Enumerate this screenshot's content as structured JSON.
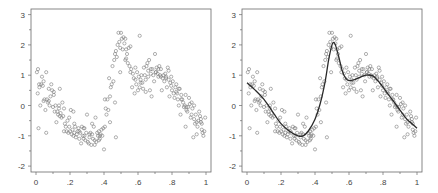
{
  "chart_data": [
    {
      "type": "scatter",
      "title": "",
      "xlabel": "",
      "ylabel": "",
      "xlim": [
        0,
        1
      ],
      "ylim": [
        -2,
        3
      ],
      "x_ticks": [
        0,
        0.2,
        0.4,
        0.6,
        0.8,
        1
      ],
      "x_tick_labels": [
        "0",
        ".2",
        ".4",
        ".6",
        ".8",
        "1"
      ],
      "y_ticks": [
        -2,
        -1,
        0,
        1,
        2,
        3
      ],
      "y_tick_labels": [
        "-2",
        "-1",
        "0",
        "1",
        "2",
        "3"
      ],
      "grid": false,
      "legend": null,
      "series": [
        {
          "name": "observations",
          "marker": "open-circle",
          "x": [
            0.005,
            0.01,
            0.012,
            0.018,
            0.02,
            0.025,
            0.03,
            0.035,
            0.04,
            0.045,
            0.05,
            0.055,
            0.06,
            0.065,
            0.07,
            0.075,
            0.08,
            0.085,
            0.09,
            0.095,
            0.1,
            0.105,
            0.11,
            0.115,
            0.12,
            0.125,
            0.13,
            0.135,
            0.14,
            0.145,
            0.15,
            0.155,
            0.16,
            0.165,
            0.17,
            0.175,
            0.18,
            0.185,
            0.19,
            0.195,
            0.2,
            0.205,
            0.21,
            0.215,
            0.22,
            0.225,
            0.23,
            0.235,
            0.24,
            0.245,
            0.25,
            0.255,
            0.26,
            0.265,
            0.27,
            0.275,
            0.28,
            0.285,
            0.29,
            0.295,
            0.3,
            0.305,
            0.31,
            0.315,
            0.32,
            0.325,
            0.33,
            0.335,
            0.34,
            0.345,
            0.35,
            0.355,
            0.36,
            0.365,
            0.37,
            0.375,
            0.38,
            0.385,
            0.39,
            0.395,
            0.4,
            0.405,
            0.41,
            0.415,
            0.42,
            0.425,
            0.43,
            0.435,
            0.44,
            0.445,
            0.45,
            0.455,
            0.46,
            0.465,
            0.47,
            0.475,
            0.48,
            0.485,
            0.49,
            0.495,
            0.5,
            0.505,
            0.51,
            0.515,
            0.52,
            0.525,
            0.53,
            0.535,
            0.54,
            0.545,
            0.55,
            0.555,
            0.56,
            0.565,
            0.57,
            0.575,
            0.58,
            0.585,
            0.59,
            0.595,
            0.6,
            0.605,
            0.61,
            0.615,
            0.62,
            0.625,
            0.63,
            0.635,
            0.64,
            0.645,
            0.65,
            0.655,
            0.66,
            0.665,
            0.67,
            0.675,
            0.68,
            0.685,
            0.69,
            0.695,
            0.7,
            0.705,
            0.71,
            0.715,
            0.72,
            0.725,
            0.73,
            0.735,
            0.74,
            0.745,
            0.75,
            0.755,
            0.76,
            0.765,
            0.77,
            0.775,
            0.78,
            0.785,
            0.79,
            0.795,
            0.8,
            0.805,
            0.81,
            0.815,
            0.82,
            0.825,
            0.83,
            0.835,
            0.84,
            0.845,
            0.85,
            0.855,
            0.86,
            0.865,
            0.87,
            0.875,
            0.88,
            0.885,
            0.89,
            0.895,
            0.9,
            0.905,
            0.91,
            0.915,
            0.92,
            0.925,
            0.93,
            0.935,
            0.94,
            0.945,
            0.95,
            0.955,
            0.96,
            0.965,
            0.97,
            0.975,
            0.98,
            0.985,
            0.99,
            0.995,
            0.015,
            0.045,
            0.075,
            0.105,
            0.135,
            0.165,
            0.195,
            0.225,
            0.255,
            0.285,
            0.315,
            0.345,
            0.375,
            0.405,
            0.435,
            0.465,
            0.495,
            0.525,
            0.555,
            0.585,
            0.615,
            0.645,
            0.675,
            0.705,
            0.735,
            0.765,
            0.795,
            0.825,
            0.855,
            0.885,
            0.915,
            0.945,
            0.975,
            0.06,
            0.14,
            0.22,
            0.28,
            0.33,
            0.37,
            0.47,
            0.53,
            0.61,
            0.66,
            0.72,
            0.78,
            0.84,
            0.88,
            0.93,
            0.97
          ],
          "y": [
            1.1,
            0.4,
            1.2,
            0.7,
            0.6,
            0.0,
            0.7,
            0.95,
            0.65,
            0.15,
            0.2,
            -0.15,
            1.1,
            0.2,
            0.1,
            0.15,
            0.0,
            0.3,
            0.7,
            0.5,
            -0.05,
            0.45,
            -0.2,
            0.0,
            -0.55,
            -0.2,
            -0.3,
            -0.1,
            -0.35,
            -0.25,
            -0.4,
            0.1,
            -0.35,
            -0.85,
            -0.6,
            -0.7,
            -0.85,
            -0.5,
            -0.9,
            -0.4,
            -0.85,
            -0.15,
            -0.95,
            -0.8,
            -1.0,
            -0.9,
            -0.7,
            -1.05,
            -0.95,
            -0.85,
            -0.75,
            -1.1,
            -0.9,
            -1.25,
            -0.7,
            -1.0,
            -1.1,
            -0.75,
            -1.15,
            -0.9,
            -0.3,
            -1.2,
            -1.25,
            -0.95,
            -0.9,
            -1.3,
            -0.6,
            -1.1,
            -0.7,
            -1.3,
            -0.4,
            -1.2,
            -0.9,
            -1.0,
            -0.85,
            -1.1,
            -0.95,
            -0.8,
            -1.0,
            -0.75,
            -1.45,
            0.2,
            -0.1,
            -0.3,
            0.2,
            -0.15,
            0.9,
            0.3,
            0.6,
            0.7,
            1.3,
            0.8,
            1.5,
            1.7,
            1.8,
            1.6,
            2.0,
            2.4,
            2.1,
            1.9,
            2.4,
            2.2,
            1.85,
            2.25,
            2.05,
            1.5,
            1.85,
            1.7,
            1.4,
            1.9,
            1.3,
            1.1,
            1.2,
            0.6,
            1.05,
            0.9,
            0.4,
            0.85,
            0.7,
            1.1,
            0.5,
            0.95,
            0.6,
            0.85,
            1.0,
            0.75,
            0.55,
            1.25,
            1.0,
            0.45,
            1.3,
            1.4,
            1.15,
            1.5,
            0.5,
            1.2,
            0.3,
            1.2,
            1.0,
            0.8,
            1.7,
            1.1,
            1.25,
            1.05,
            0.95,
            1.3,
            1.0,
            1.2,
            0.5,
            0.9,
            1.0,
            0.8,
            1.05,
            0.95,
            0.6,
            1.25,
            0.85,
            0.3,
            0.75,
            0.95,
            0.5,
            0.8,
            0.4,
            0.25,
            0.6,
            0.7,
            0.4,
            0.2,
            0.0,
            0.55,
            -0.3,
            0.35,
            0.2,
            0.1,
            -0.05,
            0.0,
            -0.7,
            -0.15,
            -0.2,
            -0.05,
            0.25,
            0.05,
            -0.4,
            0.1,
            -0.1,
            -1.05,
            -0.45,
            -0.6,
            -0.3,
            -0.95,
            -0.7,
            -0.5,
            -0.2,
            -0.35,
            -0.55,
            -0.8,
            -0.9,
            -1.0,
            -0.85,
            -0.4,
            -0.75,
            0.8,
            0.55,
            0.35,
            0.0,
            -0.1,
            -0.7,
            -0.6,
            -0.85,
            -1.0,
            -1.05,
            -1.15,
            -1.0,
            -0.7,
            -0.55,
            0.1,
            1.1,
            2.2,
            1.95,
            1.25,
            0.75,
            0.85,
            1.05,
            1.1,
            0.95,
            0.9,
            0.65,
            0.45,
            0.2,
            -0.05,
            -0.3,
            -0.55,
            -0.6,
            -0.9,
            0.55,
            -0.2,
            -0.75,
            -0.95,
            -1.15,
            -1.05,
            1.55,
            2.3,
            0.95,
            1.2,
            1.15,
            0.55,
            0.35,
            0.0,
            -0.45,
            -0.8
          ]
        }
      ]
    },
    {
      "type": "scatter",
      "title": "",
      "xlabel": "",
      "ylabel": "",
      "xlim": [
        0,
        1
      ],
      "ylim": [
        -2,
        3
      ],
      "x_ticks": [
        0,
        0.2,
        0.4,
        0.6,
        0.8,
        1
      ],
      "x_tick_labels": [
        "0",
        ".2",
        ".4",
        ".6",
        ".8",
        "1"
      ],
      "y_ticks": [
        -2,
        -1,
        0,
        1,
        2,
        3
      ],
      "y_tick_labels": [
        "-2",
        "-1",
        "0",
        "1",
        "2",
        "3"
      ],
      "grid": false,
      "legend": null,
      "series": [
        {
          "name": "observations",
          "marker": "open-circle",
          "same_as": "chart_data[0].series[0]"
        },
        {
          "name": "fitted curve",
          "type": "line",
          "x": [
            0,
            0.05,
            0.1,
            0.15,
            0.2,
            0.25,
            0.3,
            0.33,
            0.36,
            0.4,
            0.43,
            0.46,
            0.48,
            0.5,
            0.51,
            0.52,
            0.54,
            0.56,
            0.58,
            0.6,
            0.63,
            0.66,
            0.7,
            0.74,
            0.78,
            0.82,
            0.86,
            0.9,
            0.94,
            0.97,
            1.0
          ],
          "y": [
            0.75,
            0.5,
            0.2,
            -0.2,
            -0.6,
            -0.85,
            -1.0,
            -1.0,
            -0.85,
            -0.45,
            0.05,
            0.8,
            1.5,
            2.0,
            2.08,
            2.0,
            1.6,
            1.15,
            0.9,
            0.82,
            0.85,
            0.92,
            1.0,
            0.98,
            0.75,
            0.45,
            0.15,
            -0.15,
            -0.45,
            -0.6,
            -0.75
          ]
        }
      ]
    }
  ]
}
